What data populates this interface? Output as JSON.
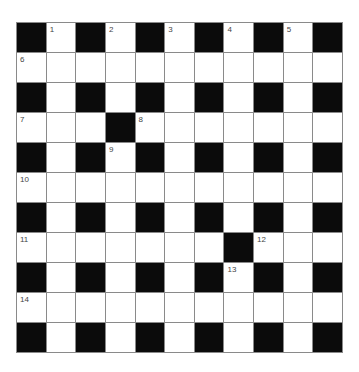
{
  "puzzle": {
    "type": "crossword",
    "rows": 11,
    "cols": 11,
    "colors": {
      "block": "#0b0b0b",
      "open": "#ffffff",
      "gridline": "#8a8a8a",
      "number": "#444444"
    },
    "layout": [
      "#.#.#.#.#.#",
      "...........",
      "#.#.#.#.#.#",
      "...#.......",
      "#.#.#.#.#.#",
      "...........",
      "#.#.#.#.#.#",
      ".......#...",
      "#.#.#.#.#.#",
      "...........",
      "#.#.#.#.#.#"
    ],
    "numbers": [
      {
        "row": 0,
        "col": 1,
        "label": "1"
      },
      {
        "row": 0,
        "col": 3,
        "label": "2"
      },
      {
        "row": 0,
        "col": 5,
        "label": "3"
      },
      {
        "row": 0,
        "col": 7,
        "label": "4"
      },
      {
        "row": 0,
        "col": 9,
        "label": "5"
      },
      {
        "row": 1,
        "col": 0,
        "label": "6"
      },
      {
        "row": 3,
        "col": 0,
        "label": "7"
      },
      {
        "row": 3,
        "col": 4,
        "label": "8"
      },
      {
        "row": 4,
        "col": 3,
        "label": "9"
      },
      {
        "row": 5,
        "col": 0,
        "label": "10"
      },
      {
        "row": 7,
        "col": 0,
        "label": "11"
      },
      {
        "row": 7,
        "col": 8,
        "label": "12"
      },
      {
        "row": 8,
        "col": 7,
        "label": "13"
      },
      {
        "row": 9,
        "col": 0,
        "label": "14"
      }
    ]
  }
}
